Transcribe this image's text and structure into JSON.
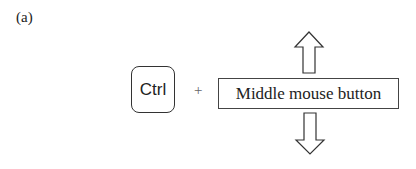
{
  "figure": {
    "panel_label": "(a)",
    "key": "Ctrl",
    "operator": "+",
    "action": "Middle mouse button",
    "arrows": [
      {
        "direction": "up",
        "icon": "arrow-up-icon"
      },
      {
        "direction": "down",
        "icon": "arrow-down-icon"
      }
    ]
  }
}
